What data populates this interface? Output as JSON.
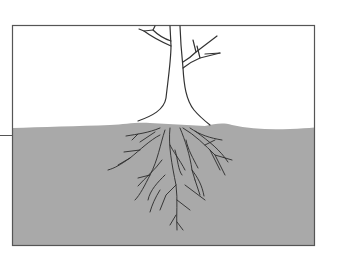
{
  "diagram": {
    "parts": [
      {
        "id": "sky",
        "label": "air above ground"
      },
      {
        "id": "trunk",
        "label": "tree trunk with branches"
      },
      {
        "id": "soil",
        "label": "soil"
      },
      {
        "id": "roots",
        "label": "branching roots"
      },
      {
        "id": "pointer-line",
        "label": "leader line at ground level"
      }
    ],
    "colors": {
      "frame": "#555555",
      "soil": "#a9a9a9",
      "outline": "#333333",
      "background": "#ffffff"
    }
  }
}
